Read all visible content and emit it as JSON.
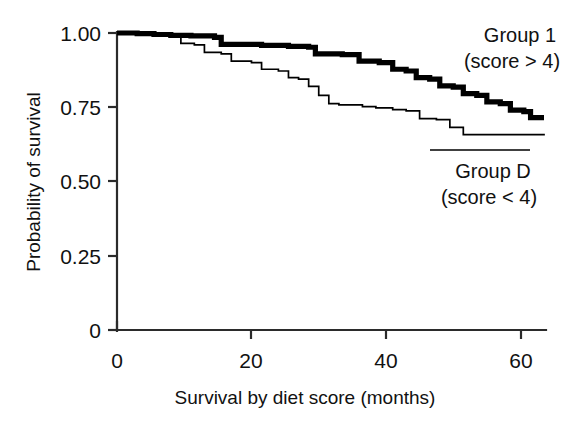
{
  "chart_data": {
    "type": "line",
    "title": "",
    "xlabel": "Survival by diet score (months)",
    "ylabel": "Probability of survival",
    "xlim": [
      0,
      63.5
    ],
    "ylim": [
      0,
      1.0
    ],
    "xticks": [
      0,
      20,
      40,
      60
    ],
    "xtick_labels": [
      "0",
      "20",
      "40",
      "60"
    ],
    "yticks": [
      0,
      0.25,
      0.5,
      0.75,
      1.0
    ],
    "ytick_labels": [
      "0",
      "0.25",
      "0.50",
      "0.75",
      "1.00"
    ],
    "grid": false,
    "legend_position": "right-inside",
    "series": [
      {
        "name": "Group 1",
        "label_line1": "Group 1",
        "label_line2": "(score > 4)",
        "style": "bold-step",
        "color": "#000000",
        "steps": [
          [
            0,
            1.0
          ],
          [
            3,
            0.998
          ],
          [
            5.5,
            0.995
          ],
          [
            8,
            0.992
          ],
          [
            11,
            0.99
          ],
          [
            14.5,
            0.985
          ],
          [
            15.5,
            0.962
          ],
          [
            21.5,
            0.958
          ],
          [
            25.5,
            0.955
          ],
          [
            28.5,
            0.952
          ],
          [
            29.5,
            0.93
          ],
          [
            33.5,
            0.927
          ],
          [
            36,
            0.905
          ],
          [
            39,
            0.9
          ],
          [
            41,
            0.878
          ],
          [
            43,
            0.872
          ],
          [
            44.5,
            0.85
          ],
          [
            46.5,
            0.845
          ],
          [
            48,
            0.822
          ],
          [
            50,
            0.818
          ],
          [
            51.5,
            0.796
          ],
          [
            53.5,
            0.79
          ],
          [
            55,
            0.768
          ],
          [
            57,
            0.762
          ],
          [
            58.5,
            0.74
          ],
          [
            60.5,
            0.735
          ],
          [
            61.5,
            0.715
          ],
          [
            63.5,
            0.715
          ]
        ]
      },
      {
        "name": "Group D",
        "label_line1": "Group D",
        "label_line2": "(score < 4)",
        "style": "thin-step",
        "color": "#000000",
        "steps": [
          [
            0,
            1.0
          ],
          [
            5,
            0.998
          ],
          [
            8,
            0.99
          ],
          [
            9.5,
            0.965
          ],
          [
            11.5,
            0.96
          ],
          [
            13,
            0.935
          ],
          [
            15.5,
            0.93
          ],
          [
            17,
            0.905
          ],
          [
            20,
            0.9
          ],
          [
            21.5,
            0.878
          ],
          [
            24,
            0.872
          ],
          [
            25.5,
            0.85
          ],
          [
            27,
            0.845
          ],
          [
            28.5,
            0.82
          ],
          [
            30,
            0.79
          ],
          [
            31.5,
            0.762
          ],
          [
            33,
            0.758
          ],
          [
            36.5,
            0.752
          ],
          [
            38.5,
            0.748
          ],
          [
            41,
            0.742
          ],
          [
            43,
            0.738
          ],
          [
            45,
            0.712
          ],
          [
            47.5,
            0.708
          ],
          [
            49.5,
            0.682
          ],
          [
            51.5,
            0.658
          ],
          [
            63.5,
            0.655
          ]
        ]
      }
    ]
  },
  "annotations": {
    "group1_line1": "Group 1",
    "group1_line2": "(score > 4)",
    "groupd_line1": "Group D",
    "groupd_line2": "(score < 4)"
  },
  "axes": {
    "y_label": "Probability of survival",
    "x_label": "Survival by diet score (months)",
    "ytick_0": "0",
    "ytick_025": "0.25",
    "ytick_050": "0.50",
    "ytick_075": "0.75",
    "ytick_100": "1.00",
    "xtick_0": "0",
    "xtick_20": "20",
    "xtick_40": "40",
    "xtick_60": "60"
  }
}
